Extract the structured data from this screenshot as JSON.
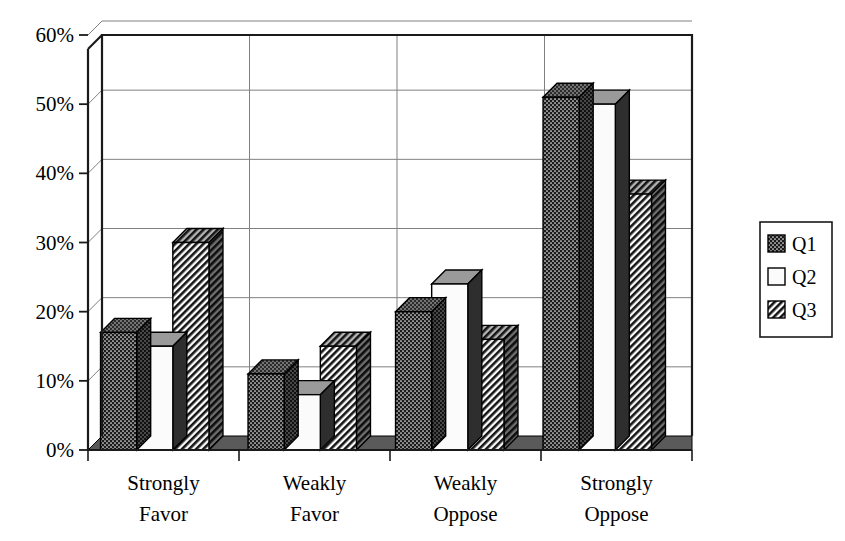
{
  "chart_data": {
    "type": "bar",
    "title": "",
    "xlabel": "",
    "ylabel": "",
    "categories": [
      "Strongly Favor",
      "Weakly Favor",
      "Weakly Oppose",
      "Strongly Oppose"
    ],
    "category_lines": [
      [
        "Strongly",
        "Favor"
      ],
      [
        "Weakly",
        "Favor"
      ],
      [
        "Weakly",
        "Oppose"
      ],
      [
        "Strongly",
        "Oppose"
      ]
    ],
    "series": [
      {
        "name": "Q1",
        "pattern": "stipple-dark",
        "values": [
          17,
          11,
          20,
          51
        ]
      },
      {
        "name": "Q2",
        "pattern": "solid-white",
        "values": [
          15,
          8,
          24,
          50
        ]
      },
      {
        "name": "Q3",
        "pattern": "diagonal-hatch",
        "values": [
          30,
          15,
          16,
          37
        ]
      }
    ],
    "ylim": [
      0,
      60
    ],
    "ytick_values": [
      0,
      10,
      20,
      30,
      40,
      50,
      60
    ],
    "ytick_labels": [
      "0%",
      "10%",
      "20%",
      "30%",
      "40%",
      "50%",
      "60%"
    ],
    "grid": true,
    "grid_horizontal": true,
    "grid_vertical_category_separators": true,
    "legend": {
      "position": "right",
      "entries": [
        {
          "label": "Q1",
          "pattern": "stipple-dark"
        },
        {
          "label": "Q2",
          "pattern": "solid-white"
        },
        {
          "label": "Q3",
          "pattern": "diagonal-hatch"
        }
      ]
    },
    "style": {
      "three_d": true,
      "depth_px": 14,
      "plot_background": "#ffffff",
      "frame_color": "#1a1a1a",
      "gridline_color": "#808080",
      "floor_color": "#5a5a5a",
      "bar_outline": "#000000",
      "bar_top_shade": "#8c8c8c",
      "bar_side_shade": "#3a3a3a"
    }
  }
}
